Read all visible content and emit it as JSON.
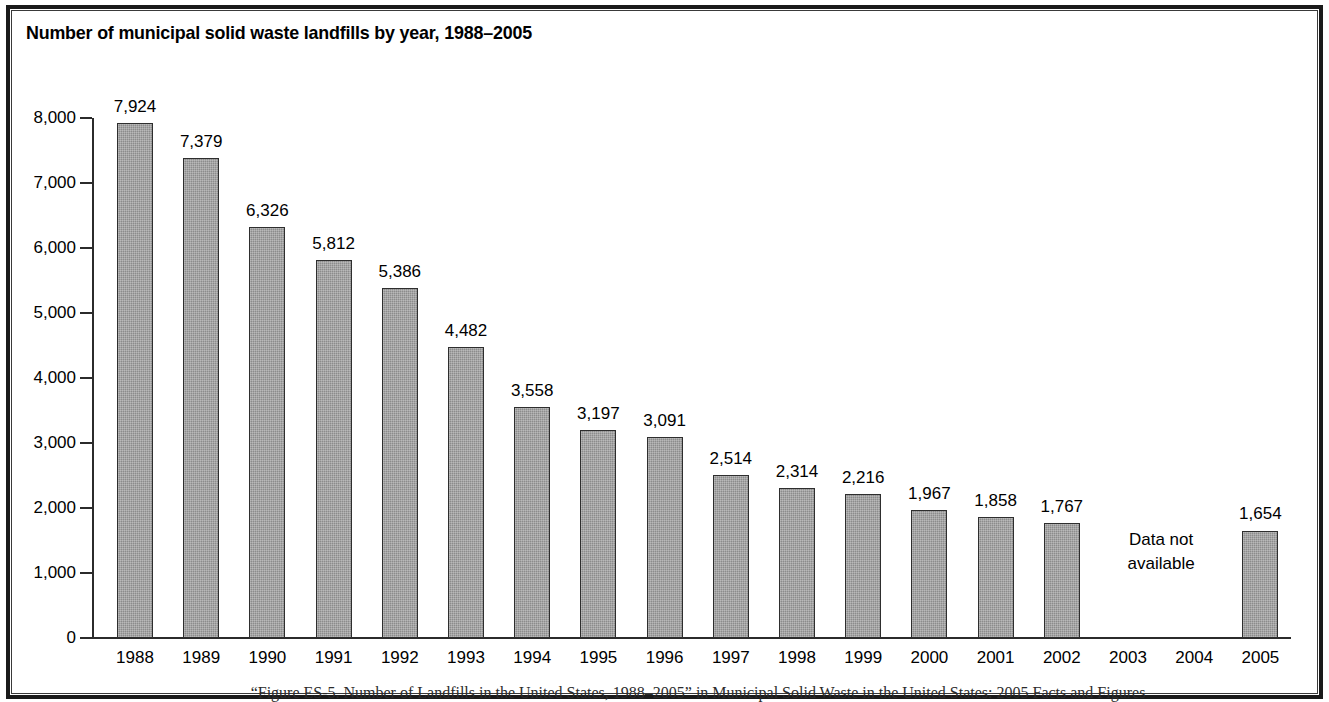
{
  "title": "Number of municipal solid waste landfills by year, 1988–2005",
  "no_data_note": "Data not\navailable",
  "no_data_line1": "Data not",
  "no_data_line2": "available",
  "footer_citation": "“Figure ES-5. Number of Landfills in the United States, 1988–2005” in Municipal Solid Waste in the United States: 2005 Facts and Figures",
  "colors": {
    "bar_fill": "#8c8c8c",
    "bar_outline": "#2e2e2e",
    "axis": "#2b2b2b",
    "frame": "#1a1a1a",
    "text": "#000000",
    "background": "#ffffff"
  },
  "chart_data": {
    "type": "bar",
    "title": "Number of municipal solid waste landfills by year, 1988–2005",
    "xlabel": "",
    "ylabel": "",
    "ylim": [
      0,
      8000
    ],
    "yticks": [
      0,
      1000,
      2000,
      3000,
      4000,
      5000,
      6000,
      7000,
      8000
    ],
    "ytick_labels": [
      "0",
      "1,000",
      "2,000",
      "3,000",
      "4,000",
      "5,000",
      "6,000",
      "7,000",
      "8,000"
    ],
    "grid": false,
    "legend": null,
    "categories": [
      "1988",
      "1989",
      "1990",
      "1991",
      "1992",
      "1993",
      "1994",
      "1995",
      "1996",
      "1997",
      "1998",
      "1999",
      "2000",
      "2001",
      "2002",
      "2003",
      "2004",
      "2005"
    ],
    "values": [
      7924,
      7379,
      6326,
      5812,
      5386,
      4482,
      3558,
      3197,
      3091,
      2514,
      2314,
      2216,
      1967,
      1858,
      1767,
      null,
      null,
      1654
    ],
    "value_labels": [
      "7,924",
      "7,379",
      "6,326",
      "5,812",
      "5,386",
      "4,482",
      "3,558",
      "3,197",
      "3,091",
      "2,514",
      "2,314",
      "2,216",
      "1,967",
      "1,858",
      "1,767",
      "",
      "",
      "1,654"
    ],
    "annotations": [
      {
        "text": "Data not available",
        "categories": [
          "2003",
          "2004"
        ]
      }
    ]
  }
}
